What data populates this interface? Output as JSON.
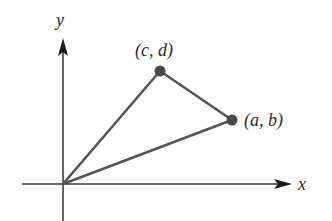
{
  "diagram": {
    "type": "coordinate-triangle",
    "axes": {
      "x_label": "x",
      "y_label": "y",
      "origin": [
        63,
        184
      ]
    },
    "points": [
      {
        "id": "origin",
        "label": "",
        "px": [
          63,
          184
        ]
      },
      {
        "id": "A",
        "label": "(a, b)",
        "px": [
          232,
          120
        ]
      },
      {
        "id": "C",
        "label": "(c, d)",
        "px": [
          160,
          71
        ]
      }
    ],
    "edges": [
      [
        "origin",
        "C"
      ],
      [
        "origin",
        "A"
      ],
      [
        "C",
        "A"
      ]
    ],
    "colors": {
      "axis": "#3a3a3a",
      "edge": "#555555",
      "point": "#4a4a4a",
      "text": "#2a2a2a"
    }
  }
}
